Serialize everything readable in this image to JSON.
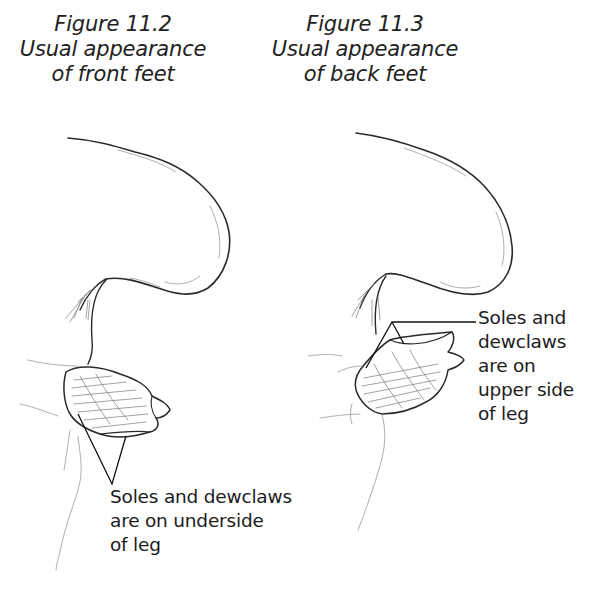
{
  "figures": [
    {
      "id": "figure-11-2",
      "caption": {
        "number": "Figure 11.2",
        "line1": "Usual appearance",
        "line2": "of front feet"
      },
      "callout": {
        "line1": "Soles and dewclaws",
        "line2": "are on underside",
        "line3": "of leg"
      }
    },
    {
      "id": "figure-11-3",
      "caption": {
        "number": "Figure 11.3",
        "line1": "Usual appearance",
        "line2": "of back feet"
      },
      "callout": {
        "line1": "Soles and",
        "line2": "dewclaws",
        "line3": "are on",
        "line4": "upper side",
        "line5": "of leg"
      }
    }
  ],
  "colors": {
    "background": "#ffffff",
    "ink": "#222222"
  }
}
